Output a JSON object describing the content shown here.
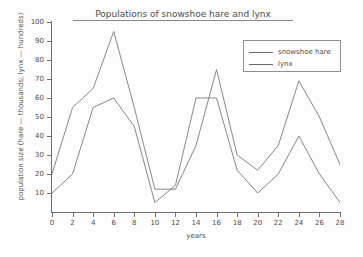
{
  "chart_data": {
    "type": "line",
    "title": "Populations of snowshoe hare and lynx",
    "xlabel": "years",
    "ylabel": "population size (hare — thousands; lynx — hundreds)",
    "x": [
      0,
      2,
      4,
      6,
      8,
      10,
      12,
      14,
      16,
      18,
      20,
      22,
      24,
      26,
      28
    ],
    "xlim": [
      0,
      28
    ],
    "ylim": [
      0,
      100
    ],
    "xticks": [
      0,
      2,
      4,
      6,
      8,
      10,
      12,
      14,
      16,
      18,
      20,
      22,
      24,
      26,
      28
    ],
    "yticks": [
      0,
      10,
      20,
      30,
      40,
      50,
      60,
      70,
      80,
      90,
      100
    ],
    "grid": false,
    "legend_position": "top-right",
    "series": [
      {
        "name": "snowshoe hare",
        "color": "#7a7a7a",
        "values": [
          20,
          55,
          65,
          95,
          55,
          12,
          12,
          35,
          75,
          30,
          22,
          35,
          69,
          50,
          25
        ]
      },
      {
        "name": "lynx",
        "color": "#7a7a7a",
        "values": [
          10,
          20,
          55,
          60,
          45,
          5,
          14,
          60,
          60,
          22,
          10,
          20,
          40,
          20,
          5
        ]
      }
    ]
  },
  "legend": {
    "entries": [
      {
        "label": "snowshoe hare"
      },
      {
        "label": "lynx"
      }
    ]
  },
  "axes": {
    "y_tick_labels": [
      "100",
      "90",
      "80",
      "70",
      "60",
      "50",
      "40",
      "30",
      "20",
      "10"
    ],
    "x_tick_labels": [
      "0",
      "2",
      "4",
      "6",
      "8",
      "10",
      "12",
      "14",
      "16",
      "18",
      "20",
      "22",
      "24",
      "26",
      "28"
    ]
  }
}
